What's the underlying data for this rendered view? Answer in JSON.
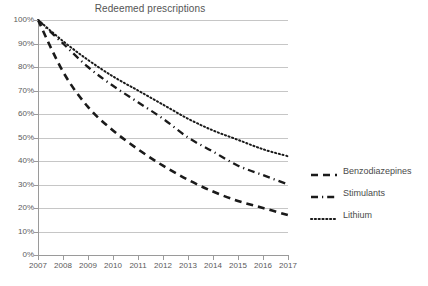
{
  "chart_data": {
    "type": "line",
    "title": "Redeemed prescriptions",
    "xlabel": "",
    "ylabel": "",
    "x": [
      2007,
      2008,
      2009,
      2010,
      2011,
      2012,
      2013,
      2014,
      2015,
      2016,
      2017
    ],
    "categories": [
      "2007",
      "2008",
      "2009",
      "2010",
      "2011",
      "2012",
      "2013",
      "2014",
      "2015",
      "2016",
      "2017"
    ],
    "xlim": [
      2007,
      2017
    ],
    "ylim": [
      0,
      100
    ],
    "ytick_labels": [
      "0%",
      "10%",
      "20%",
      "30%",
      "40%",
      "50%",
      "60%",
      "70%",
      "80%",
      "90%",
      "100%"
    ],
    "ytick_values": [
      0,
      10,
      20,
      30,
      40,
      50,
      60,
      70,
      80,
      90,
      100
    ],
    "grid": true,
    "legend_position": "right",
    "series": [
      {
        "name": "Benzodiazepines",
        "style": "dashed",
        "color": "#1a1a1a",
        "values": [
          100,
          78,
          63,
          53,
          45,
          38,
          32,
          27,
          23,
          20,
          17
        ]
      },
      {
        "name": "Stimulants",
        "style": "dash-dot",
        "color": "#1a1a1a",
        "values": [
          100,
          90,
          80,
          72,
          65,
          58,
          50,
          44,
          38,
          34,
          30
        ]
      },
      {
        "name": "Lithium",
        "style": "dotted",
        "color": "#1a1a1a",
        "values": [
          100,
          91,
          83,
          76,
          70,
          64,
          58,
          53,
          49,
          45,
          42
        ]
      }
    ]
  },
  "legend": {
    "items": [
      {
        "label": "Benzodiazepines",
        "style": "dashed"
      },
      {
        "label": "Stimulants",
        "style": "dash-dot"
      },
      {
        "label": "Lithium",
        "style": "dotted"
      }
    ]
  },
  "colors": {
    "gridline": "#c6c6c6",
    "axis": "#9a9a9a",
    "series": "#1a1a1a",
    "text": "#4a4a4a",
    "background": "#ffffff"
  }
}
